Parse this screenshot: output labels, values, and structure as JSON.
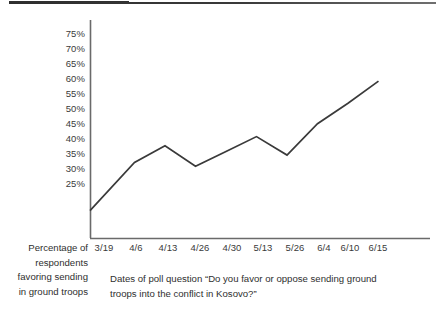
{
  "figure": {
    "name": "kosovo-ground-troops-poll-line-chart",
    "top_rule": "horizontal-rule"
  },
  "axis_titles": {
    "y_lines": [
      "Percentage of",
      "respondents",
      "favoring sending",
      "in ground troops"
    ],
    "x_caption_lines": [
      "Dates of poll question “Do you favor or oppose sending ground",
      "troops into the conflict in Kosovo?”"
    ]
  },
  "colors": {
    "line": "#3a3a3a",
    "axis": "#6a6a6a",
    "text": "#2f2f2f",
    "background": "#ffffff"
  },
  "chart_data": {
    "type": "line",
    "title": "",
    "xlabel": "Dates of poll question “Do you favor or oppose sending ground troops into the conflict in Kosovo?”",
    "ylabel": "Percentage of respondents favoring sending in ground troops",
    "categories": [
      "3/19",
      "4/6",
      "4/13",
      "4/26",
      "4/30",
      "5/13",
      "5/26",
      "6/4",
      "6/10",
      "6/15"
    ],
    "values": [
      27,
      40,
      44.5,
      39,
      43,
      47,
      42,
      50.5,
      56,
      62
    ],
    "value_labels": [
      "27%",
      "40%",
      "44.5%",
      "39%",
      "43%",
      "47%",
      "42%",
      "50.5%",
      "56%",
      "62%"
    ],
    "ylim": [
      22.5,
      77.5
    ],
    "ytick_labels": [
      "75%",
      "70%",
      "65%",
      "60%",
      "55%",
      "50%",
      "45%",
      "40%",
      "35%",
      "30%",
      "25%"
    ],
    "ytick_values": [
      75,
      70,
      65,
      60,
      55,
      50,
      45,
      40,
      35,
      30,
      25
    ],
    "grid": false,
    "legend": "none",
    "series_count": 1
  }
}
